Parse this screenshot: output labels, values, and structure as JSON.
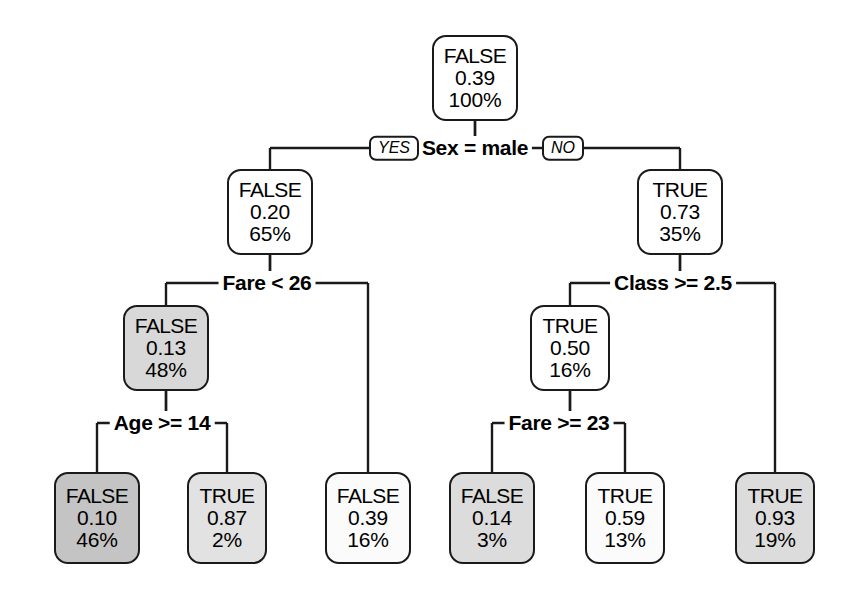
{
  "figure": {
    "type": "decision-tree",
    "title": "",
    "background": "#ffffff",
    "line_color": "#1a1a1a"
  },
  "chart_data": {
    "type": "tree",
    "title": "",
    "node_fields": [
      "class",
      "probability",
      "percent"
    ],
    "branch_labels": [
      "YES",
      "NO"
    ],
    "nodes": [
      {
        "id": "root",
        "class": "FALSE",
        "probability": "0.39",
        "percent": "100%",
        "fill": "#ffffff",
        "x": 475,
        "y": 78,
        "w": 86,
        "h": 86,
        "leaf": false
      },
      {
        "id": "n2",
        "class": "FALSE",
        "probability": "0.20",
        "percent": "65%",
        "fill": "#ffffff",
        "x": 270,
        "y": 212,
        "w": 86,
        "h": 86,
        "leaf": false
      },
      {
        "id": "n3",
        "class": "TRUE",
        "probability": "0.73",
        "percent": "35%",
        "fill": "#ffffff",
        "x": 680,
        "y": 212,
        "w": 86,
        "h": 86,
        "leaf": false
      },
      {
        "id": "n4",
        "class": "FALSE",
        "probability": "0.13",
        "percent": "48%",
        "fill": "#d8d8d8",
        "x": 166,
        "y": 348,
        "w": 86,
        "h": 86,
        "leaf": false
      },
      {
        "id": "n6",
        "class": "TRUE",
        "probability": "0.50",
        "percent": "16%",
        "fill": "#ffffff",
        "x": 570,
        "y": 348,
        "w": 80,
        "h": 86,
        "leaf": false
      },
      {
        "id": "l1",
        "class": "FALSE",
        "probability": "0.10",
        "percent": "46%",
        "fill": "#c4c4c4",
        "x": 97,
        "y": 518,
        "w": 86,
        "h": 92,
        "leaf": true
      },
      {
        "id": "l2",
        "class": "TRUE",
        "probability": "0.87",
        "percent": "2%",
        "fill": "#e2e2e2",
        "x": 227,
        "y": 518,
        "w": 80,
        "h": 92,
        "leaf": true
      },
      {
        "id": "l3",
        "class": "FALSE",
        "probability": "0.39",
        "percent": "16%",
        "fill": "#fbfbfb",
        "x": 368,
        "y": 518,
        "w": 86,
        "h": 92,
        "leaf": true
      },
      {
        "id": "l4",
        "class": "FALSE",
        "probability": "0.14",
        "percent": "3%",
        "fill": "#dcdcdc",
        "x": 492,
        "y": 518,
        "w": 86,
        "h": 92,
        "leaf": true
      },
      {
        "id": "l5",
        "class": "TRUE",
        "probability": "0.59",
        "percent": "13%",
        "fill": "#fbfbfb",
        "x": 625,
        "y": 518,
        "w": 80,
        "h": 92,
        "leaf": true
      },
      {
        "id": "l6",
        "class": "TRUE",
        "probability": "0.93",
        "percent": "19%",
        "fill": "#dcdcdc",
        "x": 775,
        "y": 518,
        "w": 80,
        "h": 92,
        "leaf": true
      }
    ],
    "splits": [
      {
        "id": "s1",
        "label": "Sex = male",
        "x": 475,
        "y": 148,
        "yes_child": "n2",
        "no_child": "n3",
        "show_tags": true,
        "yes_tag_x": 394,
        "no_tag_x": 563
      },
      {
        "id": "s2",
        "label": "Fare < 26",
        "x": 267,
        "y": 283,
        "yes_child": "n4",
        "no_child": "l3",
        "show_tags": false
      },
      {
        "id": "s3",
        "label": "Class >= 2.5",
        "x": 673,
        "y": 283,
        "yes_child": "n6",
        "no_child": "l6",
        "show_tags": false
      },
      {
        "id": "s4",
        "label": "Age >= 14",
        "x": 162,
        "y": 423,
        "yes_child": "l1",
        "no_child": "l2",
        "show_tags": false
      },
      {
        "id": "s5",
        "label": "Fare >= 23",
        "x": 559,
        "y": 423,
        "yes_child": "l4",
        "no_child": "l5",
        "show_tags": false
      }
    ],
    "edges": [
      {
        "from": "root",
        "to": "n2",
        "kind": "elbow"
      },
      {
        "from": "root",
        "to": "n3",
        "kind": "elbow"
      },
      {
        "from": "n2",
        "to": "n4",
        "kind": "elbow"
      },
      {
        "from": "n2",
        "to": "l3",
        "kind": "elbow-long"
      },
      {
        "from": "n3",
        "to": "n6",
        "kind": "elbow"
      },
      {
        "from": "n3",
        "to": "l6",
        "kind": "elbow-long"
      },
      {
        "from": "n4",
        "to": "l1",
        "kind": "elbow"
      },
      {
        "from": "n4",
        "to": "l2",
        "kind": "elbow"
      },
      {
        "from": "n6",
        "to": "l4",
        "kind": "elbow"
      },
      {
        "from": "n6",
        "to": "l5",
        "kind": "elbow"
      }
    ]
  }
}
